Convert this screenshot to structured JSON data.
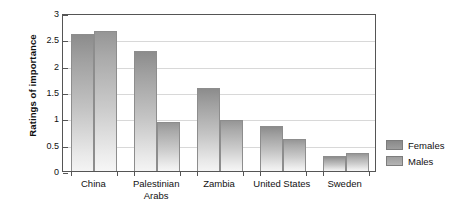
{
  "chart_data": {
    "type": "bar",
    "title": "",
    "subtitle": "",
    "xlabel": "",
    "ylabel": "Ratings of importance",
    "categories": [
      "China",
      "Palestinian Arabs",
      "Zambia",
      "United States",
      "Sweden"
    ],
    "series": [
      {
        "name": "Females",
        "values": [
          2.6,
          2.28,
          1.58,
          0.86,
          0.28
        ]
      },
      {
        "name": "Males",
        "values": [
          2.65,
          0.93,
          0.97,
          0.6,
          0.35
        ]
      }
    ],
    "ylim": [
      0,
      3
    ],
    "ytick_labels": [
      "0",
      "0.5",
      "1",
      "1.5",
      "2",
      "2.5",
      "3"
    ],
    "ytick_values": [
      0,
      0.5,
      1,
      1.5,
      2,
      2.5,
      3
    ],
    "grid": true,
    "grid_axis": "y",
    "legend_position": "right",
    "legend": [
      {
        "label": "Females",
        "color": "#9a9a9a"
      },
      {
        "label": "Males",
        "color": "#b0b0b0"
      }
    ]
  },
  "colors": {
    "axis": "#555555",
    "gridline": "#d8d8d8",
    "text": "#111111",
    "background": "#ffffff",
    "females_bar": "#9a9a9a",
    "males_bar": "#b0b0b0"
  }
}
